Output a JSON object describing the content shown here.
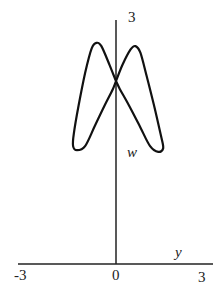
{
  "chart_data": {
    "type": "line",
    "title": "",
    "xlabel": "y",
    "ylabel": "w",
    "xlim": [
      -3,
      3
    ],
    "ylim": [
      0,
      3
    ],
    "x_ticks": [
      "-3",
      "0",
      "3"
    ],
    "y_ticks": [
      "3"
    ],
    "grid": false,
    "legend": null,
    "series": [
      {
        "name": "curve",
        "color": "#111111",
        "points": [
          [
            0.0,
            2.25
          ],
          [
            -0.2,
            2.45
          ],
          [
            -0.45,
            2.68
          ],
          [
            -0.6,
            2.72
          ],
          [
            -0.75,
            2.65
          ],
          [
            -0.95,
            2.35
          ],
          [
            -1.15,
            1.95
          ],
          [
            -1.3,
            1.6
          ],
          [
            -1.32,
            1.45
          ],
          [
            -1.2,
            1.4
          ],
          [
            -0.95,
            1.45
          ],
          [
            -0.65,
            1.7
          ],
          [
            -0.35,
            1.95
          ],
          [
            -0.1,
            2.15
          ],
          [
            0.0,
            2.25
          ],
          [
            0.2,
            2.45
          ],
          [
            0.45,
            2.64
          ],
          [
            0.6,
            2.68
          ],
          [
            0.75,
            2.6
          ],
          [
            0.95,
            2.3
          ],
          [
            1.2,
            1.9
          ],
          [
            1.4,
            1.55
          ],
          [
            1.45,
            1.42
          ],
          [
            1.3,
            1.38
          ],
          [
            1.05,
            1.45
          ],
          [
            0.75,
            1.68
          ],
          [
            0.4,
            1.95
          ],
          [
            0.12,
            2.15
          ],
          [
            0.0,
            2.25
          ]
        ]
      }
    ]
  },
  "labels": {
    "y_top_tick": "3",
    "y_axis_label": "w",
    "x_axis_label": "y",
    "x_tick_left": "-3",
    "x_tick_zero": "0",
    "x_tick_right": "3"
  }
}
